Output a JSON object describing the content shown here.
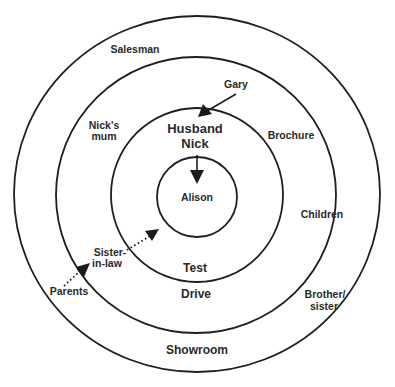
{
  "diagram": {
    "type": "concentric-circles",
    "rings": [
      {
        "name": "outer",
        "cx": 197,
        "cy": 194,
        "rx": 183,
        "ry": 178
      },
      {
        "name": "second",
        "cx": 196,
        "cy": 195,
        "rx": 140,
        "ry": 138
      },
      {
        "name": "third",
        "cx": 197,
        "cy": 195,
        "rx": 86,
        "ry": 87
      },
      {
        "name": "inner",
        "cx": 197,
        "cy": 197,
        "rx": 40,
        "ry": 40
      }
    ],
    "labels": {
      "salesman": "Salesman",
      "gary": "Gary",
      "nicks_mum_line1": "Nick's",
      "nicks_mum_line2": "mum",
      "brochure": "Brochure",
      "husband_line1": "Husband",
      "husband_line2": "Nick",
      "alison": "Alison",
      "children": "Children",
      "sister_in_law_line1": "Sister-",
      "sister_in_law_line2": "in-law",
      "parents": "Parents",
      "test": "Test",
      "drive": "Drive",
      "brother_sister_line1": "Brother/",
      "brother_sister_line2": "sister",
      "showroom": "Showroom"
    },
    "arrows": [
      {
        "from": "Gary",
        "to": "Husband Nick",
        "style": "solid"
      },
      {
        "from": "Husband Nick",
        "to": "Alison",
        "style": "solid"
      },
      {
        "from": "Sister-in-law",
        "to": "Alison",
        "style": "dotted"
      },
      {
        "from": "Parents",
        "to": "Sister-in-law",
        "style": "dotted"
      }
    ],
    "colors": {
      "line": "#1e1e1e",
      "text": "#2a2a2a",
      "background": "#ffffff"
    }
  }
}
